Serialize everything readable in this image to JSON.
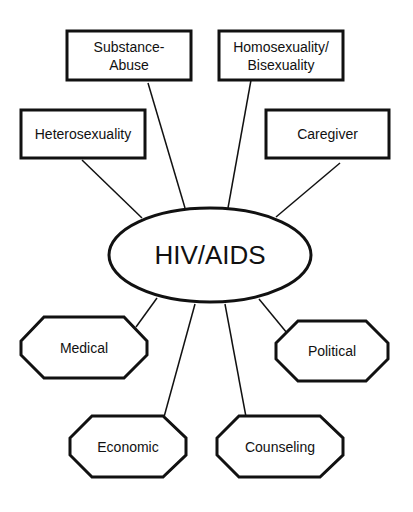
{
  "diagram": {
    "center": {
      "label": "HIV/AIDS"
    },
    "boxes": [
      {
        "id": "substance-abuse",
        "line1": "Substance-",
        "line2": "Abuse"
      },
      {
        "id": "homosexuality",
        "line1": "Homosexuality/",
        "line2": "Bisexuality"
      },
      {
        "id": "heterosexuality",
        "line1": "Heterosexuality",
        "line2": ""
      },
      {
        "id": "caregiver",
        "line1": "Caregiver",
        "line2": ""
      }
    ],
    "octagons": [
      {
        "id": "medical",
        "label": "Medical"
      },
      {
        "id": "political",
        "label": "Political"
      },
      {
        "id": "economic",
        "label": "Economic"
      },
      {
        "id": "counseling",
        "label": "Counseling"
      }
    ],
    "colors": {
      "stroke": "#111111",
      "background": "#ffffff"
    }
  }
}
